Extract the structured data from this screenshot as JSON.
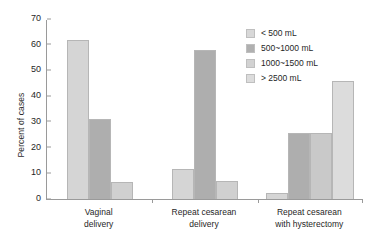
{
  "chart_data": {
    "type": "bar",
    "title": "",
    "xlabel": "",
    "ylabel": "Percent of cases",
    "ylim": [
      0,
      70
    ],
    "yticks": [
      0,
      10,
      20,
      30,
      40,
      50,
      60,
      70
    ],
    "grid": false,
    "legend_position": "top-right",
    "categories": [
      "Vaginal delivery",
      "Repeat cesarean delivery",
      "Repeat cesarean with hysterectomy"
    ],
    "category_lines": [
      [
        "Vaginal",
        "delivery"
      ],
      [
        "Repeat cesarean",
        "delivery"
      ],
      [
        "Repeat cesarean",
        "with hysterectomy"
      ]
    ],
    "series": [
      {
        "name": "< 500 mL",
        "color": "#d5d5d5",
        "values": [
          62,
          11.5,
          2.5
        ]
      },
      {
        "name": "500~1000 mL",
        "color": "#aeaeae",
        "values": [
          31,
          58,
          25.5
        ]
      },
      {
        "name": "1000~1500 mL",
        "color": "#d0d0d0",
        "values": [
          6.5,
          7,
          25.5
        ]
      },
      {
        "name": "> 2500 mL",
        "color": "#dcdcdc",
        "values": [
          null,
          null,
          46
        ]
      }
    ],
    "groups": [
      {
        "label": "Vaginal delivery",
        "bars": [
          {
            "series": "< 500 mL",
            "value": 62,
            "color": "#d5d5d5"
          },
          {
            "series": "500~1000 mL",
            "value": 31,
            "color": "#aeaeae"
          },
          {
            "series": "1000~1500 mL",
            "value": 6.5,
            "color": "#d0d0d0"
          }
        ]
      },
      {
        "label": "Repeat cesarean delivery",
        "bars": [
          {
            "series": "< 500 mL",
            "value": 11.5,
            "color": "#d5d5d5"
          },
          {
            "series": "500~1000 mL",
            "value": 58,
            "color": "#aeaeae"
          },
          {
            "series": "1000~1500 mL",
            "value": 7,
            "color": "#d0d0d0"
          }
        ]
      },
      {
        "label": "Repeat cesarean with hysterectomy",
        "bars": [
          {
            "series": "< 500 mL",
            "value": 2.5,
            "color": "#d5d5d5"
          },
          {
            "series": "500~1000 mL",
            "value": 25.5,
            "color": "#aeaeae"
          },
          {
            "series": "1000~1500 mL",
            "value": 25.5,
            "color": "#c9c9c9"
          },
          {
            "series": "> 2500 mL",
            "value": 46,
            "color": "#dcdcdc"
          }
        ]
      }
    ],
    "legend": [
      {
        "label": "< 500 mL",
        "color": "#d8d8d8"
      },
      {
        "label": "500~1000 mL",
        "color": "#b0b0b0"
      },
      {
        "label": "1000~1500 mL",
        "color": "#d2d2d2"
      },
      {
        "label": "> 2500 mL",
        "color": "#dcdcdc"
      }
    ]
  },
  "axis": {
    "y_title": "Percent of cases",
    "tick_labels": [
      "70",
      "60",
      "50",
      "40",
      "30",
      "20",
      "10",
      "0"
    ]
  },
  "colors": {
    "axis_line": "#9a9a9a",
    "bar_outline": "#b6b6b6",
    "text": "#1f1f1f",
    "background": "#ffffff"
  }
}
